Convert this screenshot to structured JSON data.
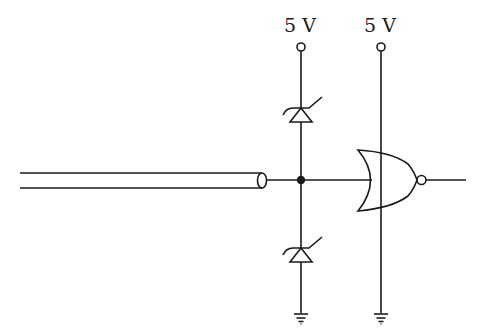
{
  "diagram": {
    "type": "circuit-schematic",
    "labels": {
      "supply_left": "5 V",
      "supply_right": "5 V"
    },
    "components": [
      {
        "id": "coax-cable",
        "kind": "coaxial-cable-input"
      },
      {
        "id": "junction",
        "kind": "junction-dot"
      },
      {
        "id": "zener-top",
        "kind": "zener-diode",
        "to": "5 V"
      },
      {
        "id": "zener-bottom",
        "kind": "zener-diode",
        "to": "ground"
      },
      {
        "id": "nor-gate",
        "kind": "NOR gate"
      },
      {
        "id": "supply-left",
        "kind": "supply-terminal",
        "label": "5 V"
      },
      {
        "id": "supply-right",
        "kind": "supply-terminal",
        "label": "5 V"
      },
      {
        "id": "ground-left",
        "kind": "ground"
      },
      {
        "id": "ground-right",
        "kind": "ground"
      }
    ],
    "colors": {
      "stroke": "#1a1a1a",
      "background": "#ffffff"
    }
  }
}
